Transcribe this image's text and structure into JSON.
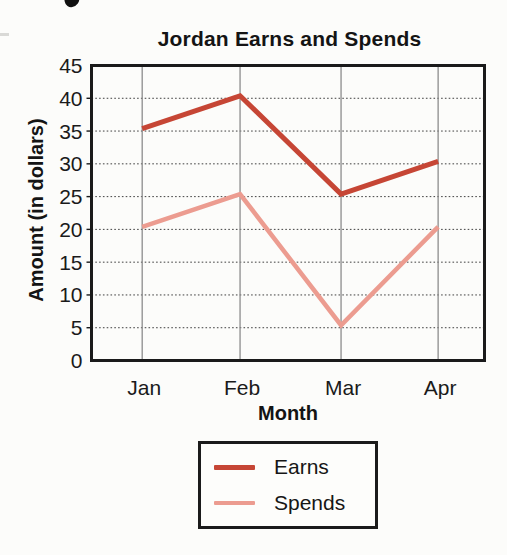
{
  "chart_data": {
    "type": "line",
    "title": "Jordan Earns and Spends",
    "xlabel": "Month",
    "ylabel": "Amount (in dollars)",
    "categories": [
      "Jan",
      "Feb",
      "Mar",
      "Apr"
    ],
    "series": [
      {
        "name": "Earns",
        "color": "#c64635",
        "values": [
          35,
          40,
          25,
          30
        ]
      },
      {
        "name": "Spends",
        "color": "#ec9c90",
        "values": [
          20,
          25,
          5,
          20
        ]
      }
    ],
    "ylim": [
      0,
      45
    ],
    "ytick_step": 5,
    "yticks": [
      0,
      5,
      10,
      15,
      20,
      25,
      30,
      35,
      40,
      45
    ],
    "grid": true,
    "legend_position": "bottom",
    "colors": {
      "frame": "#1a1a1a",
      "h_gridline": "#3f3f3f",
      "v_gridline": "#8c8c8c",
      "background": "#fcfcfa"
    }
  }
}
